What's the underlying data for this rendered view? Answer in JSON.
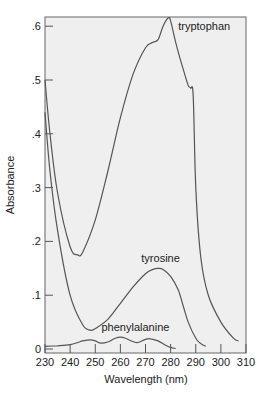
{
  "chart_data": {
    "type": "line",
    "title": "",
    "xlabel": "Wavelength (nm)",
    "ylabel": "Absorbance",
    "xlim": [
      230,
      310
    ],
    "ylim": [
      0,
      0.62
    ],
    "xticks": [
      230,
      240,
      250,
      260,
      270,
      280,
      290,
      300,
      310
    ],
    "xtick_labels": [
      "230",
      "240",
      "250",
      "260",
      "270",
      "280",
      "290",
      "300",
      "310"
    ],
    "yticks": [
      0,
      0.1,
      0.2,
      0.3,
      0.4,
      0.5,
      0.6
    ],
    "ytick_labels": [
      "0",
      ".1",
      ".2",
      ".3",
      ".4",
      ".5",
      ".6"
    ],
    "grid": false,
    "background": "#efefef",
    "line_color": "#555555",
    "series": [
      {
        "name": "tryptophan",
        "x": [
          230,
          232,
          235,
          240,
          243,
          245,
          250,
          255,
          260,
          265,
          270,
          273,
          275,
          277,
          279,
          280,
          282,
          285,
          287,
          288,
          289,
          290,
          292,
          295,
          300,
          305,
          307
        ],
        "values": [
          0.5,
          0.4,
          0.29,
          0.19,
          0.175,
          0.18,
          0.24,
          0.33,
          0.43,
          0.51,
          0.56,
          0.57,
          0.575,
          0.6,
          0.615,
          0.61,
          0.57,
          0.52,
          0.49,
          0.485,
          0.47,
          0.3,
          0.17,
          0.1,
          0.05,
          0.02,
          0.015
        ]
      },
      {
        "name": "tyrosine",
        "x": [
          230,
          232,
          235,
          240,
          245,
          248,
          250,
          255,
          260,
          265,
          270,
          273,
          275,
          277,
          280,
          283,
          285,
          287,
          290,
          292,
          294
        ],
        "values": [
          0.44,
          0.33,
          0.22,
          0.1,
          0.045,
          0.035,
          0.038,
          0.055,
          0.085,
          0.115,
          0.14,
          0.148,
          0.15,
          0.148,
          0.135,
          0.11,
          0.08,
          0.05,
          0.02,
          0.01,
          0.005
        ]
      },
      {
        "name": "phenylalanine",
        "x": [
          230,
          235,
          240,
          243,
          245,
          248,
          250,
          252,
          255,
          258,
          260,
          262,
          265,
          267,
          270,
          272,
          275,
          278,
          280,
          282
        ],
        "values": [
          0.005,
          0.006,
          0.008,
          0.012,
          0.015,
          0.017,
          0.015,
          0.011,
          0.013,
          0.02,
          0.022,
          0.02,
          0.014,
          0.012,
          0.018,
          0.019,
          0.015,
          0.007,
          0.003,
          0.001
        ]
      }
    ],
    "annotations": [
      {
        "text": "tryptophan",
        "x": 283,
        "y": 0.6
      },
      {
        "text": "tyrosine",
        "x": 276,
        "y": 0.17
      },
      {
        "text": "phenylalanine",
        "x": 266,
        "y": 0.04
      }
    ]
  }
}
